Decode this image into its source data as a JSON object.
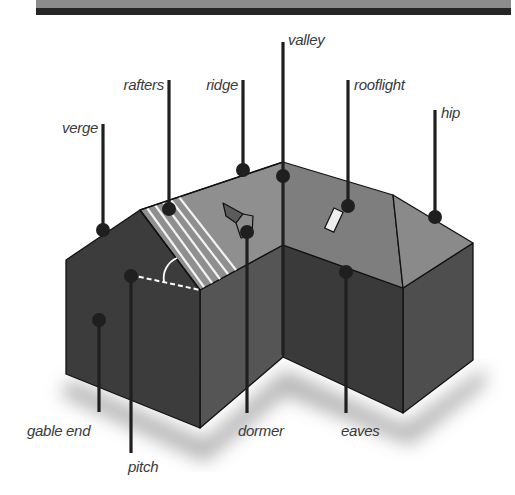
{
  "header_band": {
    "top_color": "#8c8c8c",
    "bottom_color": "#262626"
  },
  "diagram": {
    "title": "",
    "colors": {
      "roof_light": "#8f8f8f",
      "roof_mid": "#7d7d7d",
      "wall_dark": "#3d3d3d",
      "wall_mid": "#555555",
      "wall_end": "#4a4a4a",
      "outline": "#111111",
      "pointer": "#1f1f1f",
      "rafter_stripe": "#f2f2f2",
      "rooflight": "#eeeeee",
      "label_text": "#3a3a3a"
    },
    "labels": {
      "verge": "verge",
      "rafters": "rafters",
      "ridge": "ridge",
      "valley": "valley",
      "rooflight": "rooflight",
      "hip": "hip",
      "gable_end": "gable end",
      "pitch": "pitch",
      "dormer": "dormer",
      "eaves": "eaves"
    }
  }
}
